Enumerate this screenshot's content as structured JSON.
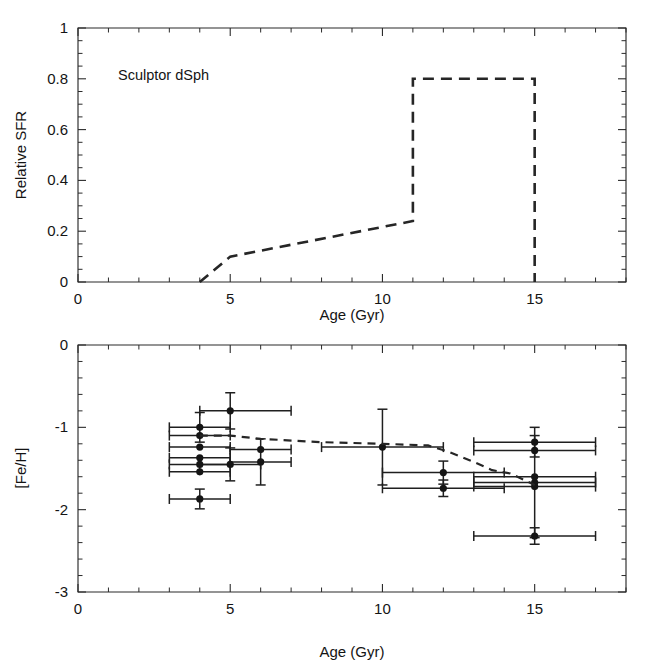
{
  "figure": {
    "title": "",
    "panels": [
      "sfr-panel",
      "feh-panel"
    ]
  },
  "annotations": {
    "galaxy_label": "Sculptor dSph"
  },
  "axis_labels": {
    "top_x": "Age (Gyr)",
    "top_y": "Relative SFR",
    "bottom_x": "Age (Gyr)",
    "bottom_y": "[Fe/H]"
  },
  "ticks": {
    "top_x": [
      "0",
      "5",
      "10",
      "15"
    ],
    "top_y": [
      "0",
      "0.2",
      "0.4",
      "0.6",
      "0.8",
      "1"
    ],
    "bottom_x": [
      "0",
      "5",
      "10",
      "15"
    ],
    "bottom_y": [
      "-3",
      "-2",
      "-1",
      "0"
    ]
  },
  "chart_data": [
    {
      "id": "sfr-panel",
      "type": "line",
      "title": "Sculptor dSph",
      "xlabel": "Age (Gyr)",
      "ylabel": "Relative SFR",
      "xlim": [
        0,
        18
      ],
      "ylim": [
        0,
        1
      ],
      "xticks": [
        0,
        5,
        10,
        15
      ],
      "yticks": [
        0,
        0.2,
        0.4,
        0.6,
        0.8,
        1
      ],
      "xminor_step": 1,
      "yminor_step": 0.05,
      "grid": false,
      "legend": "none",
      "linestyle": "dashed",
      "series": [
        {
          "name": "Relative star formation rate",
          "x": [
            4.0,
            5.0,
            11.0,
            11.0,
            15.0,
            15.0
          ],
          "y": [
            0.0,
            0.1,
            0.24,
            0.8,
            0.8,
            0.0
          ]
        }
      ]
    },
    {
      "id": "feh-panel",
      "type": "scatter",
      "title": "",
      "xlabel": "Age (Gyr)",
      "ylabel": "[Fe/H]",
      "xlim": [
        0,
        18
      ],
      "ylim": [
        -3,
        0
      ],
      "xticks": [
        0,
        5,
        10,
        15
      ],
      "yticks": [
        -3,
        -2,
        -1,
        0
      ],
      "xminor_step": 1,
      "yminor_step": 0.2,
      "grid": false,
      "legend": "none",
      "points": [
        {
          "x": 5.0,
          "y": -0.8,
          "xerr_lo": 1.0,
          "xerr_hi": 2.0,
          "yerr": 0.22
        },
        {
          "x": 4.0,
          "y": -1.0,
          "xerr_lo": 1.0,
          "xerr_hi": 1.0,
          "yerr": 0.18
        },
        {
          "x": 4.0,
          "y": -1.1,
          "xerr_lo": 1.0,
          "xerr_hi": 1.0,
          "yerr": 0.0
        },
        {
          "x": 4.0,
          "y": -1.24,
          "xerr_lo": 1.0,
          "xerr_hi": 1.0,
          "yerr": 0.0
        },
        {
          "x": 4.0,
          "y": -1.37,
          "xerr_lo": 1.0,
          "xerr_hi": 1.0,
          "yerr": 0.0
        },
        {
          "x": 4.0,
          "y": -1.45,
          "xerr_lo": 1.0,
          "xerr_hi": 1.0,
          "yerr": 0.0
        },
        {
          "x": 4.0,
          "y": -1.54,
          "xerr_lo": 1.0,
          "xerr_hi": 1.0,
          "yerr": 0.0
        },
        {
          "x": 4.0,
          "y": -1.87,
          "xerr_lo": 1.0,
          "xerr_hi": 1.0,
          "yerr": 0.12
        },
        {
          "x": 5.0,
          "y": -1.45,
          "xerr_lo": 1.0,
          "xerr_hi": 1.0,
          "yerr": 0.2
        },
        {
          "x": 6.0,
          "y": -1.27,
          "xerr_lo": 1.0,
          "xerr_hi": 1.0,
          "yerr": 0.0
        },
        {
          "x": 6.0,
          "y": -1.42,
          "xerr_lo": 1.0,
          "xerr_hi": 1.0,
          "yerr": 0.28
        },
        {
          "x": 10.0,
          "y": -1.24,
          "xerr_lo": 2.0,
          "xerr_hi": 2.0,
          "yerr": 0.46
        },
        {
          "x": 12.0,
          "y": -1.55,
          "xerr_lo": 2.0,
          "xerr_hi": 2.0,
          "yerr": 0.14
        },
        {
          "x": 12.0,
          "y": -1.74,
          "xerr_lo": 2.0,
          "xerr_hi": 2.0,
          "yerr": 0.1
        },
        {
          "x": 15.0,
          "y": -1.18,
          "xerr_lo": 2.0,
          "xerr_hi": 2.0,
          "yerr": 0.18
        },
        {
          "x": 15.0,
          "y": -1.28,
          "xerr_lo": 2.0,
          "xerr_hi": 2.0,
          "yerr": 0.0
        },
        {
          "x": 15.0,
          "y": -1.6,
          "xerr_lo": 2.0,
          "xerr_hi": 2.0,
          "yerr": 0.0
        },
        {
          "x": 15.0,
          "y": -1.67,
          "xerr_lo": 2.0,
          "xerr_hi": 2.0,
          "yerr": 0.0
        },
        {
          "x": 15.0,
          "y": -1.72,
          "xerr_lo": 2.0,
          "xerr_hi": 2.0,
          "yerr": 0.62
        },
        {
          "x": 15.0,
          "y": -2.32,
          "xerr_lo": 2.0,
          "xerr_hi": 2.0,
          "yerr": 0.1
        }
      ],
      "model_curve": {
        "name": "Age-metallicity relation",
        "linestyle": "dashed",
        "x": [
          4.0,
          5.0,
          6.0,
          8.0,
          10.0,
          11.5,
          12.2,
          13.0,
          13.6,
          14.2,
          15.0
        ],
        "y": [
          -1.1,
          -1.1,
          -1.14,
          -1.18,
          -1.2,
          -1.22,
          -1.3,
          -1.42,
          -1.52,
          -1.56,
          -1.7
        ]
      }
    }
  ],
  "colors": {
    "axis": "#2b2b2b",
    "curve": "#262626",
    "marker": "#151515",
    "background": "#ffffff"
  }
}
